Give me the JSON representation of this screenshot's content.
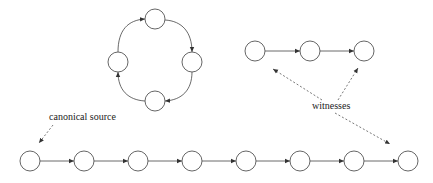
{
  "diagram": {
    "labels": {
      "canonical_source": "canonical source",
      "witnesses": "witnesses"
    },
    "cycle": {
      "nodes": [
        {
          "id": "c-top",
          "cx": 155,
          "cy": 19
        },
        {
          "id": "c-right",
          "cx": 192,
          "cy": 62
        },
        {
          "id": "c-bottom",
          "cx": 155,
          "cy": 101
        },
        {
          "id": "c-left",
          "cx": 118,
          "cy": 62
        }
      ],
      "edges": [
        [
          "c-left",
          "c-top"
        ],
        [
          "c-top",
          "c-right"
        ],
        [
          "c-right",
          "c-bottom"
        ],
        [
          "c-bottom",
          "c-left"
        ]
      ]
    },
    "witness_chain": {
      "nodes": [
        {
          "id": "w1",
          "cx": 255,
          "cy": 51
        },
        {
          "id": "w2",
          "cx": 310,
          "cy": 51
        },
        {
          "id": "w3",
          "cx": 364,
          "cy": 51
        }
      ],
      "edges": [
        [
          "w1",
          "w2"
        ],
        [
          "w2",
          "w3"
        ]
      ]
    },
    "main_chain": {
      "nodes": [
        {
          "id": "m1",
          "cx": 30,
          "cy": 161
        },
        {
          "id": "m2",
          "cx": 84,
          "cy": 161
        },
        {
          "id": "m3",
          "cx": 138,
          "cy": 161
        },
        {
          "id": "m4",
          "cx": 192,
          "cy": 161
        },
        {
          "id": "m5",
          "cx": 246,
          "cy": 161
        },
        {
          "id": "m6",
          "cx": 300,
          "cy": 161
        },
        {
          "id": "m7",
          "cx": 354,
          "cy": 161
        },
        {
          "id": "m8",
          "cx": 408,
          "cy": 161
        }
      ],
      "edges": [
        [
          "m1",
          "m2"
        ],
        [
          "m2",
          "m3"
        ],
        [
          "m3",
          "m4"
        ],
        [
          "m4",
          "m5"
        ],
        [
          "m5",
          "m6"
        ],
        [
          "m6",
          "m7"
        ],
        [
          "m7",
          "m8"
        ]
      ]
    },
    "annotations": [
      {
        "label": "canonical source",
        "points_to": "m1"
      },
      {
        "label": "witnesses",
        "points_to": [
          "w1",
          "w3",
          "m8"
        ]
      }
    ],
    "colors": {
      "stroke": "#555555",
      "text": "#222222",
      "background": "#ffffff"
    }
  }
}
